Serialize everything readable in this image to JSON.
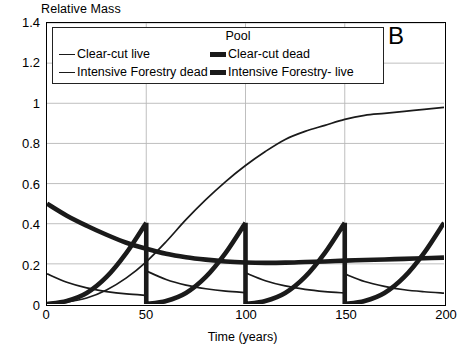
{
  "panel": {
    "label": "B"
  },
  "axes": {
    "ylabel": "Relative Mass",
    "xlabel": "Time (years)",
    "yticks": [
      "1.4",
      "1.2",
      "1",
      "0.8",
      "0.6",
      "0.4",
      "0.2",
      "0"
    ],
    "xticks": [
      "0",
      "50",
      "100",
      "150",
      "200"
    ]
  },
  "legend": {
    "title": "Pool",
    "entries": [
      {
        "label": "Clear-cut live",
        "style": "thin"
      },
      {
        "label": "Clear-cut dead",
        "style": "thick"
      },
      {
        "label": "Intensive Forestry dead",
        "style": "thin"
      },
      {
        "label": "Intensive Forestry- live",
        "style": "thick"
      }
    ]
  },
  "colors": {
    "line": "#1a1a1a",
    "grid": "#b8b8b8",
    "axis": "#000000",
    "background": "#ffffff"
  },
  "chart_data": {
    "type": "line",
    "title": "B",
    "xlabel": "Time (years)",
    "ylabel": "Relative Mass",
    "xlim": [
      0,
      200
    ],
    "ylim": [
      0,
      1.4
    ],
    "xticks": [
      0,
      50,
      100,
      150,
      200
    ],
    "yticks": [
      0,
      0.2,
      0.4,
      0.6,
      0.8,
      1.0,
      1.2,
      1.4
    ],
    "grid": true,
    "legend_position": "top-inside",
    "legend_title": "Pool",
    "series": [
      {
        "name": "Clear-cut live",
        "style": "thin",
        "description": "Sigmoidal regrowth of live biomass after a single clear-cut at time 0; approaches 0.98 by year 200.",
        "x": [
          0,
          10,
          20,
          30,
          40,
          50,
          60,
          70,
          80,
          90,
          100,
          110,
          120,
          130,
          140,
          150,
          160,
          170,
          180,
          190,
          200
        ],
        "y": [
          0.0,
          0.01,
          0.03,
          0.07,
          0.13,
          0.21,
          0.31,
          0.42,
          0.52,
          0.61,
          0.69,
          0.76,
          0.82,
          0.86,
          0.89,
          0.92,
          0.94,
          0.95,
          0.96,
          0.97,
          0.98
        ]
      },
      {
        "name": "Clear-cut dead",
        "style": "thick",
        "description": "Dead-wood pool after a single clear-cut: starts at 0.50, decays to a minimum near 0.205 around year 110, then slowly rises to 0.23.",
        "x": [
          0,
          10,
          20,
          30,
          40,
          50,
          60,
          70,
          80,
          90,
          100,
          110,
          120,
          130,
          140,
          150,
          160,
          170,
          180,
          190,
          200
        ],
        "y": [
          0.5,
          0.44,
          0.39,
          0.345,
          0.305,
          0.275,
          0.25,
          0.233,
          0.221,
          0.212,
          0.207,
          0.205,
          0.206,
          0.209,
          0.212,
          0.216,
          0.219,
          0.222,
          0.225,
          0.228,
          0.231
        ]
      },
      {
        "name": "Intensive Forestry dead",
        "style": "thin",
        "description": "Dead-wood pool under 50-year rotation intensive forestry; decays between harvests with a small step increase at each harvest (years 50, 100, 150).",
        "x": [
          0,
          10,
          20,
          30,
          40,
          50,
          50,
          60,
          70,
          80,
          90,
          100,
          100,
          110,
          120,
          130,
          140,
          150,
          150,
          160,
          170,
          180,
          190,
          200
        ],
        "y": [
          0.15,
          0.108,
          0.08,
          0.062,
          0.05,
          0.043,
          0.165,
          0.122,
          0.094,
          0.076,
          0.064,
          0.057,
          0.155,
          0.116,
          0.09,
          0.073,
          0.062,
          0.055,
          0.15,
          0.112,
          0.088,
          0.071,
          0.061,
          0.054
        ]
      },
      {
        "name": "Intensive Forestry- live",
        "style": "thick",
        "description": "Live biomass under 50-year rotation; sawtooth rising from 0 to about 0.40 at each harvest year (50, 100, 150, 200) then dropping to 0.",
        "x": [
          0,
          10,
          20,
          30,
          40,
          50,
          50,
          60,
          70,
          80,
          90,
          100,
          100,
          110,
          120,
          130,
          140,
          150,
          150,
          160,
          170,
          180,
          190,
          200
        ],
        "y": [
          0.0,
          0.015,
          0.055,
          0.135,
          0.255,
          0.405,
          0.0,
          0.015,
          0.055,
          0.135,
          0.255,
          0.405,
          0.0,
          0.015,
          0.055,
          0.135,
          0.255,
          0.405,
          0.0,
          0.015,
          0.055,
          0.135,
          0.255,
          0.405
        ]
      }
    ]
  }
}
